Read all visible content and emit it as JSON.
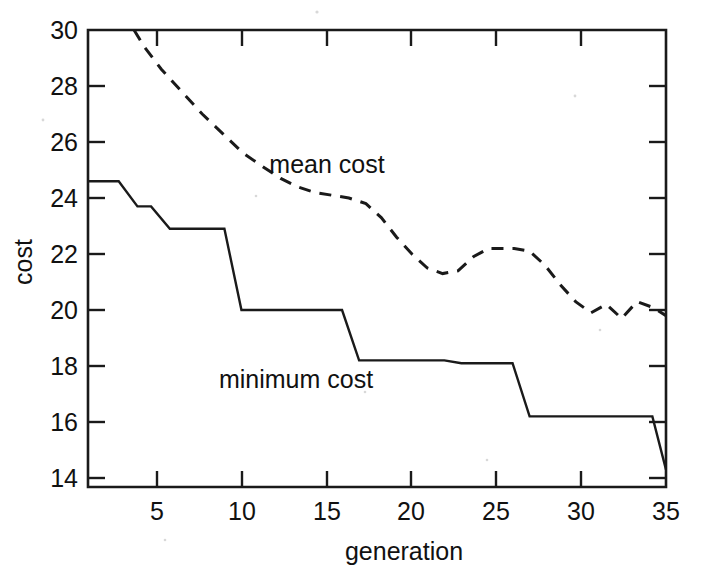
{
  "figure": {
    "background": "#ffffff",
    "ink_color": "#111111"
  },
  "axes": {
    "x_title": "generation",
    "y_title": "cost",
    "x_ticklabels": [
      "5",
      "10",
      "15",
      "20",
      "25",
      "30",
      "35"
    ],
    "y_ticklabels": [
      "30",
      "28",
      "26",
      "24",
      "22",
      "20",
      "18",
      "16",
      "14"
    ]
  },
  "annotations": {
    "mean_label": "mean cost",
    "minimum_label": "minimum cost"
  },
  "chart_data": {
    "type": "line",
    "title": "",
    "xlabel": "generation",
    "ylabel": "cost",
    "xlim": [
      1.1,
      35
    ],
    "ylim": [
      13.2,
      30
    ],
    "xticks": [
      5,
      10,
      15,
      20,
      25,
      30,
      35
    ],
    "yticks": [
      14,
      16,
      18,
      20,
      22,
      24,
      26,
      28,
      30
    ],
    "grid": false,
    "legend": "inline-annotations",
    "series": [
      {
        "name": "mean cost",
        "style": "dashed",
        "color": "#1a1a1a",
        "x": [
          3.8,
          4.4,
          5.4,
          6.6,
          7.8,
          9.0,
          10.2,
          11.4,
          12.4,
          13.4,
          14.4,
          15.4,
          16.4,
          17.4,
          18.3,
          19.2,
          20.1,
          21.0,
          21.9,
          22.8,
          23.7,
          24.6,
          25.3,
          26.1,
          27.0,
          27.9,
          28.8,
          29.7,
          30.6,
          31.5,
          32.4,
          33.3,
          34.2,
          35.0
        ],
        "y": [
          30.0,
          29.4,
          28.6,
          27.8,
          27.0,
          26.3,
          25.6,
          25.1,
          24.7,
          24.4,
          24.2,
          24.1,
          24.0,
          23.8,
          23.3,
          22.6,
          22.0,
          21.5,
          21.3,
          21.4,
          21.9,
          22.2,
          22.2,
          22.2,
          22.1,
          21.6,
          20.9,
          20.3,
          19.9,
          20.2,
          19.7,
          20.3,
          20.1,
          19.8
        ]
      },
      {
        "name": "minimum cost",
        "style": "solid",
        "color": "#1a1a1a",
        "x": [
          1.1,
          2.9,
          4.0,
          4.8,
          5.9,
          9.1,
          10.1,
          16.0,
          17.0,
          22.0,
          23.0,
          26.0,
          27.0,
          34.2,
          35.0
        ],
        "y": [
          24.6,
          24.6,
          23.7,
          23.7,
          22.9,
          22.9,
          20.0,
          20.0,
          18.2,
          18.2,
          18.1,
          18.1,
          16.2,
          16.2,
          14.3
        ]
      }
    ]
  }
}
